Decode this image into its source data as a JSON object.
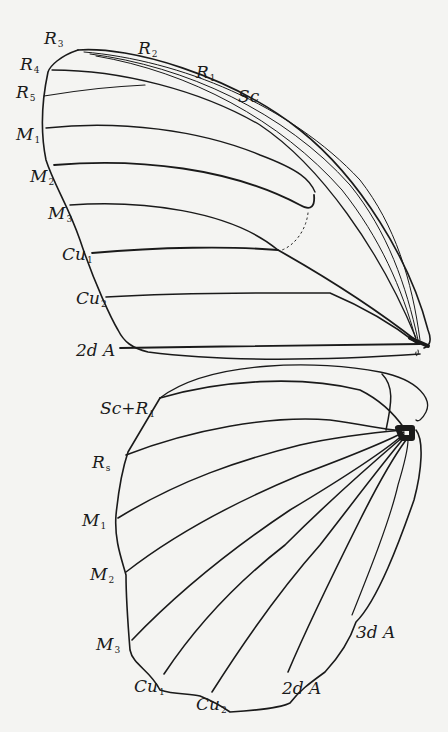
{
  "figure": {
    "colors": {
      "background": "#f4f4f2",
      "ink": "#1a1a1a"
    }
  },
  "forewing": {
    "labels": [
      {
        "id": "R3",
        "main": "R",
        "sub": "3"
      },
      {
        "id": "R2",
        "main": "R",
        "sub": "2"
      },
      {
        "id": "R1",
        "main": "R",
        "sub": "1"
      },
      {
        "id": "Sc",
        "main": "Sc",
        "sub": ""
      },
      {
        "id": "R4",
        "main": "R",
        "sub": "4"
      },
      {
        "id": "R5",
        "main": "R",
        "sub": "5"
      },
      {
        "id": "M1",
        "main": "M",
        "sub": "1"
      },
      {
        "id": "M2",
        "main": "M",
        "sub": "2"
      },
      {
        "id": "M3",
        "main": "M",
        "sub": "3"
      },
      {
        "id": "Cu1",
        "main": "Cu",
        "sub": "1"
      },
      {
        "id": "Cu2",
        "main": "Cu",
        "sub": "2"
      },
      {
        "id": "2dA",
        "main": "2d A",
        "sub": ""
      }
    ]
  },
  "hindwing": {
    "labels": [
      {
        "id": "ScR1",
        "main": "Sc+R",
        "sub": "1"
      },
      {
        "id": "Rs",
        "main": "R",
        "sub": "s"
      },
      {
        "id": "M1",
        "main": "M",
        "sub": "1"
      },
      {
        "id": "M2",
        "main": "M",
        "sub": "2"
      },
      {
        "id": "M3",
        "main": "M",
        "sub": "3"
      },
      {
        "id": "Cu1",
        "main": "Cu",
        "sub": "1"
      },
      {
        "id": "Cu2",
        "main": "Cu",
        "sub": "2"
      },
      {
        "id": "2dA",
        "main": "2d A",
        "sub": ""
      },
      {
        "id": "3dA",
        "main": "3d A",
        "sub": ""
      }
    ]
  }
}
